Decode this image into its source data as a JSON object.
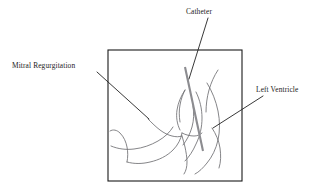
{
  "figure": {
    "type": "medical-illustration",
    "background_color": "#ffffff",
    "frame": {
      "name": "illustration-frame",
      "x": 108,
      "y": 50,
      "width": 134,
      "height": 131,
      "stroke_color": "#1a1a1a"
    },
    "labels": [
      {
        "id": "mitral-regurgitation",
        "text": "Mitral Regurgitation",
        "text_x": 12,
        "text_y": 68,
        "leader": {
          "x1": 97,
          "y1": 72,
          "x2": 149,
          "y2": 119
        }
      },
      {
        "id": "catheter",
        "text": "Catheter",
        "text_x": 186,
        "text_y": 14,
        "leader": {
          "x1": 208,
          "y1": 18,
          "x2": 189,
          "y2": 79
        }
      },
      {
        "id": "left-ventricle",
        "text": "Left Ventricle",
        "text_x": 256,
        "text_y": 92,
        "leader": {
          "x1": 263,
          "y1": 96,
          "x2": 213,
          "y2": 128
        }
      }
    ],
    "catheter_shaft": {
      "id": "catheter-shaft",
      "color": "#8c8c90",
      "x1": 185,
      "y1": 67,
      "x2": 203,
      "y2": 151,
      "width": 2.1
    },
    "anatomy": {
      "stroke_color": "#6f6f73",
      "paths": [
        "M 110 131 C 113 129 117 130 120 133 C 124 137 126 142 127 147 C 128 152 128 157 127 162",
        "M 111 146 C 118 149 126 150 134 149 C 143 148 151 145 158 141 C 165 137 170 132 173 127",
        "M 148 119 C 152 123 156 127 160 130 C 164 133 168 135 172 136 C 176 137 179 137 182 136",
        "M 127 162 C 134 164 142 164 150 162 C 159 160 167 156 173 150 C 178 145 181 139 182 133",
        "M 182 136 C 183 139 184 143 185 147 C 186 152 187 157 187 162 C 187 167 186 171 184 174",
        "M 180 122 C 179 116 179 110 180 105 C 181 99 183 94 185 90",
        "M 185 90 C 181 96 178 103 177 110 C 176 117 177 124 180 130",
        "M 182 133 C 186 135 190 136 194 136 C 197 136 200 135 202 133",
        "M 193 106 C 194 113 194 120 192 127 C 190 134 187 140 183 145",
        "M 196 92 C 200 100 202 109 202 118 C 202 127 200 136 196 144 C 193 151 189 157 185 161",
        "M 207 83 C 212 91 216 101 218 111 C 220 121 220 131 218 140 C 216 149 212 157 207 163 C 203 168 199 172 195 174",
        "M 212 128 C 216 134 219 141 220 148 C 221 155 221 162 219 168",
        "M 218 70 C 214 76 211 83 209 90 C 207 97 206 105 206 112"
      ]
    }
  }
}
